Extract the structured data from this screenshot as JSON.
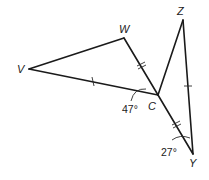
{
  "figure": {
    "points": {
      "V": {
        "label": "V"
      },
      "W": {
        "label": "W"
      },
      "C": {
        "label": "C"
      },
      "Z": {
        "label": "Z"
      },
      "Y": {
        "label": "Y"
      }
    },
    "angles": {
      "VCW_region": {
        "label": "47°",
        "vertex": "C"
      },
      "Y": {
        "label": "27°",
        "vertex": "Y"
      }
    },
    "segments": [
      "VW",
      "WC",
      "VC",
      "CZ",
      "ZY",
      "CY"
    ],
    "congruence_marks": {
      "single_tick": [
        "VC",
        "ZY"
      ],
      "double_tick": [
        "WC",
        "CY"
      ]
    }
  }
}
